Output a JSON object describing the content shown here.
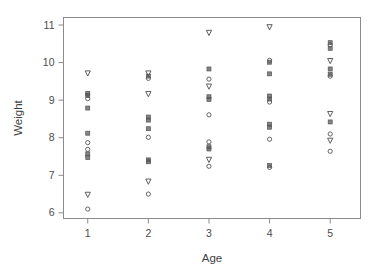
{
  "chart_data": {
    "type": "scatter",
    "title": "",
    "xlabel": "Age",
    "ylabel": "Weight",
    "xlim": [
      0.6,
      5.5
    ],
    "ylim": [
      5.85,
      11.2
    ],
    "xticks": [
      1,
      2,
      3,
      4,
      5
    ],
    "xtick_labels": [
      "1",
      "2",
      "3",
      "4",
      "5"
    ],
    "yticks": [
      6,
      7,
      8,
      9,
      10,
      11
    ],
    "ytick_labels": [
      "6",
      "7",
      "8",
      "9",
      "10",
      "11"
    ],
    "grid": false,
    "legend": "none",
    "frame": "box",
    "marker_types": [
      "circle",
      "square",
      "triangle-down"
    ],
    "marker_color": "#555555",
    "points": [
      {
        "x": 1,
        "y": 9.72,
        "marker": "triangle-down"
      },
      {
        "x": 1,
        "y": 9.18,
        "marker": "square"
      },
      {
        "x": 1,
        "y": 9.12,
        "marker": "square"
      },
      {
        "x": 1,
        "y": 9.04,
        "marker": "circle"
      },
      {
        "x": 1,
        "y": 8.79,
        "marker": "square"
      },
      {
        "x": 1,
        "y": 8.12,
        "marker": "square"
      },
      {
        "x": 1,
        "y": 7.87,
        "marker": "circle"
      },
      {
        "x": 1,
        "y": 7.69,
        "marker": "circle"
      },
      {
        "x": 1,
        "y": 7.57,
        "marker": "square"
      },
      {
        "x": 1,
        "y": 7.47,
        "marker": "square"
      },
      {
        "x": 1,
        "y": 6.49,
        "marker": "triangle-down"
      },
      {
        "x": 1,
        "y": 6.1,
        "marker": "circle"
      },
      {
        "x": 2,
        "y": 9.72,
        "marker": "triangle-down"
      },
      {
        "x": 2,
        "y": 9.64,
        "marker": "square"
      },
      {
        "x": 2,
        "y": 9.58,
        "marker": "circle"
      },
      {
        "x": 2,
        "y": 9.17,
        "marker": "triangle-down"
      },
      {
        "x": 2,
        "y": 8.55,
        "marker": "square"
      },
      {
        "x": 2,
        "y": 8.47,
        "marker": "square"
      },
      {
        "x": 2,
        "y": 8.24,
        "marker": "square"
      },
      {
        "x": 2,
        "y": 8.01,
        "marker": "circle"
      },
      {
        "x": 2,
        "y": 7.41,
        "marker": "square"
      },
      {
        "x": 2,
        "y": 7.36,
        "marker": "square"
      },
      {
        "x": 2,
        "y": 6.84,
        "marker": "triangle-down"
      },
      {
        "x": 2,
        "y": 6.5,
        "marker": "circle"
      },
      {
        "x": 3,
        "y": 10.8,
        "marker": "triangle-down"
      },
      {
        "x": 3,
        "y": 9.83,
        "marker": "square"
      },
      {
        "x": 3,
        "y": 9.56,
        "marker": "circle"
      },
      {
        "x": 3,
        "y": 9.37,
        "marker": "triangle-down"
      },
      {
        "x": 3,
        "y": 9.09,
        "marker": "square"
      },
      {
        "x": 3,
        "y": 9.02,
        "marker": "square"
      },
      {
        "x": 3,
        "y": 8.61,
        "marker": "circle"
      },
      {
        "x": 3,
        "y": 7.89,
        "marker": "circle"
      },
      {
        "x": 3,
        "y": 7.76,
        "marker": "square"
      },
      {
        "x": 3,
        "y": 7.7,
        "marker": "square"
      },
      {
        "x": 3,
        "y": 7.42,
        "marker": "triangle-down"
      },
      {
        "x": 3,
        "y": 7.24,
        "marker": "circle"
      },
      {
        "x": 4,
        "y": 10.95,
        "marker": "triangle-down"
      },
      {
        "x": 4,
        "y": 10.06,
        "marker": "circle"
      },
      {
        "x": 4,
        "y": 10.01,
        "marker": "square"
      },
      {
        "x": 4,
        "y": 9.7,
        "marker": "square"
      },
      {
        "x": 4,
        "y": 9.11,
        "marker": "square"
      },
      {
        "x": 4,
        "y": 9.03,
        "marker": "square"
      },
      {
        "x": 4,
        "y": 8.95,
        "marker": "circle"
      },
      {
        "x": 4,
        "y": 8.36,
        "marker": "square"
      },
      {
        "x": 4,
        "y": 8.28,
        "marker": "square"
      },
      {
        "x": 4,
        "y": 7.96,
        "marker": "circle"
      },
      {
        "x": 4,
        "y": 7.26,
        "marker": "square"
      },
      {
        "x": 4,
        "y": 7.21,
        "marker": "circle"
      },
      {
        "x": 5,
        "y": 10.53,
        "marker": "square"
      },
      {
        "x": 5,
        "y": 10.47,
        "marker": "circle"
      },
      {
        "x": 5,
        "y": 10.38,
        "marker": "square"
      },
      {
        "x": 5,
        "y": 10.05,
        "marker": "triangle-down"
      },
      {
        "x": 5,
        "y": 9.83,
        "marker": "square"
      },
      {
        "x": 5,
        "y": 9.69,
        "marker": "square"
      },
      {
        "x": 5,
        "y": 9.64,
        "marker": "circle"
      },
      {
        "x": 5,
        "y": 8.64,
        "marker": "triangle-down"
      },
      {
        "x": 5,
        "y": 8.42,
        "marker": "square"
      },
      {
        "x": 5,
        "y": 8.1,
        "marker": "circle"
      },
      {
        "x": 5,
        "y": 7.93,
        "marker": "triangle-down"
      },
      {
        "x": 5,
        "y": 7.64,
        "marker": "circle"
      }
    ]
  },
  "figure": {
    "background_color": "#ffffff",
    "axis_color": "#8b8b8b",
    "text_color": "#3f3f3f"
  }
}
